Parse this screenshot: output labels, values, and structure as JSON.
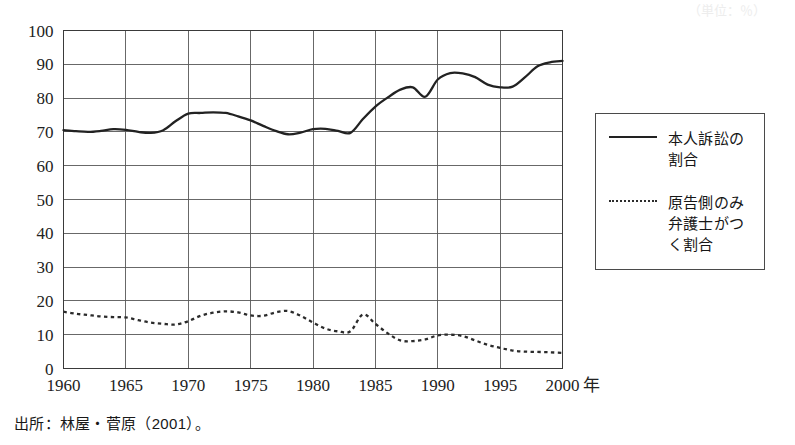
{
  "chart_data": {
    "type": "line",
    "title": "",
    "subtitle": "",
    "xlabel": "",
    "ylabel": "",
    "x_unit_label": "年",
    "xlim": [
      1960,
      2000
    ],
    "ylim": [
      0,
      100
    ],
    "x_ticks": [
      1960,
      1965,
      1970,
      1975,
      1980,
      1985,
      1990,
      1995,
      2000
    ],
    "x_tick_labels": [
      "1960",
      "1965",
      "1970",
      "1975",
      "1980",
      "1985",
      "1990",
      "1995",
      "2000"
    ],
    "y_ticks": [
      0,
      10,
      20,
      30,
      40,
      50,
      60,
      70,
      80,
      90,
      100
    ],
    "y_tick_labels": [
      "0",
      "10",
      "20",
      "30",
      "40",
      "50",
      "60",
      "70",
      "80",
      "90",
      "100"
    ],
    "grid": {
      "x": true,
      "y": true
    },
    "legend_position": "right-outside",
    "x": [
      1960,
      1961,
      1962,
      1963,
      1964,
      1965,
      1966,
      1967,
      1968,
      1969,
      1970,
      1971,
      1972,
      1973,
      1974,
      1975,
      1976,
      1977,
      1978,
      1979,
      1980,
      1981,
      1982,
      1983,
      1984,
      1985,
      1986,
      1987,
      1988,
      1989,
      1990,
      1991,
      1992,
      1993,
      1994,
      1995,
      1996,
      1997,
      1998,
      1999,
      2000
    ],
    "series": [
      {
        "name": "本人訴訟の割合",
        "style": "solid",
        "color": "#222222",
        "values": [
          70.5,
          70.2,
          70.0,
          70.3,
          70.8,
          70.6,
          70.0,
          69.7,
          70.5,
          73.2,
          75.4,
          75.6,
          75.8,
          75.6,
          74.6,
          73.4,
          71.8,
          70.3,
          69.3,
          69.8,
          70.8,
          70.9,
          70.3,
          69.7,
          73.8,
          77.5,
          80.2,
          82.5,
          83.2,
          80.4,
          85.5,
          87.4,
          87.3,
          86.2,
          84.0,
          83.2,
          83.4,
          86.2,
          89.4,
          90.6,
          91.0
        ]
      },
      {
        "name": "原告側のみ弁護士がつく割合",
        "style": "dotted",
        "color": "#2b2b2b",
        "values": [
          16.8,
          16.2,
          15.8,
          15.4,
          15.2,
          15.1,
          14.3,
          13.6,
          13.2,
          13.0,
          14.0,
          15.6,
          16.5,
          16.9,
          16.6,
          15.7,
          15.6,
          16.6,
          17.0,
          15.6,
          13.6,
          11.8,
          11.0,
          11.0,
          16.0,
          13.2,
          10.4,
          8.3,
          8.1,
          8.6,
          9.8,
          10.0,
          9.6,
          8.3,
          7.0,
          6.1,
          5.3,
          5.0,
          4.9,
          4.8,
          4.6
        ]
      }
    ]
  },
  "legend": {
    "items": [
      {
        "label": "本人訴訟の\n割合",
        "style": "solid"
      },
      {
        "label": "原告側のみ\n弁護士がつ\nく割合",
        "style": "dotted"
      }
    ]
  },
  "source": {
    "note": "出所：林屋・菅原（2001）。"
  },
  "header_artifact": {
    "text": "（単位：％）"
  },
  "colors": {
    "solid_line": "#222222",
    "dotted_line": "#2b2b2b",
    "grid": "#585858",
    "frame": "#3a3a3a",
    "text": "#1a1a1a",
    "background": "#ffffff"
  }
}
